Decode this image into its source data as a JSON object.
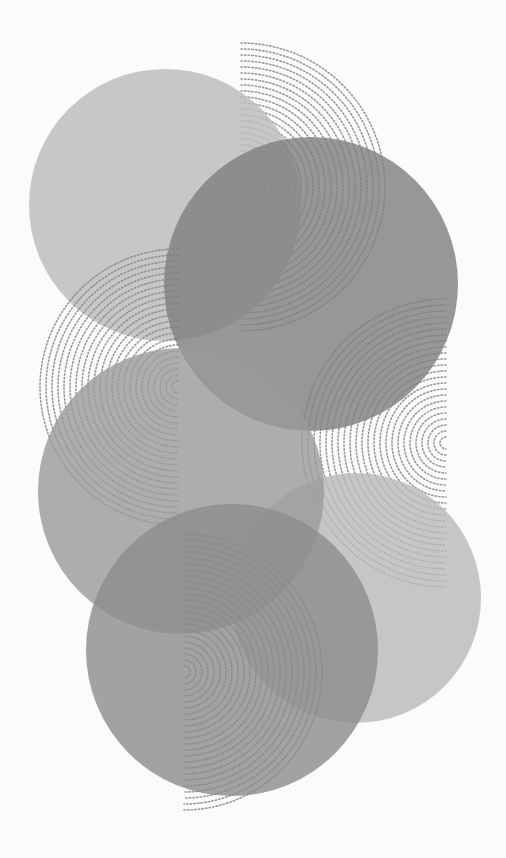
{
  "artwork": {
    "background": "#fbfbfa",
    "dot_color": "#8a8a8a",
    "circles": [
      {
        "name": "top-left-circle",
        "cx": 165,
        "cy": 205,
        "r": 136,
        "fill": "#bdbdbd",
        "opacity": 0.85
      },
      {
        "name": "top-right-circle",
        "cx": 311,
        "cy": 284,
        "r": 147,
        "fill": "#7e7e7e",
        "opacity": 0.8
      },
      {
        "name": "bottom-right-circle",
        "cx": 356,
        "cy": 598,
        "r": 125,
        "fill": "#b9b9b9",
        "opacity": 0.8
      },
      {
        "name": "middle-left-circle",
        "cx": 181,
        "cy": 491,
        "r": 143,
        "fill": "#9a9a9a",
        "opacity": 0.8
      },
      {
        "name": "bottom-circle",
        "cx": 232,
        "cy": 650,
        "r": 146,
        "fill": "#8c8c8c",
        "opacity": 0.8
      }
    ],
    "dotted_arcs": [
      {
        "name": "top-dotted-arc",
        "cx": 241,
        "cy": 187,
        "r_max": 145,
        "side": "right"
      },
      {
        "name": "left-dotted-arc",
        "cx": 178,
        "cy": 387,
        "r_max": 142,
        "side": "left"
      },
      {
        "name": "right-dotted-arc",
        "cx": 446,
        "cy": 443,
        "r_max": 145,
        "side": "left"
      },
      {
        "name": "bottom-dotted-arc",
        "cx": 184,
        "cy": 672,
        "r_max": 142,
        "side": "right"
      }
    ]
  }
}
